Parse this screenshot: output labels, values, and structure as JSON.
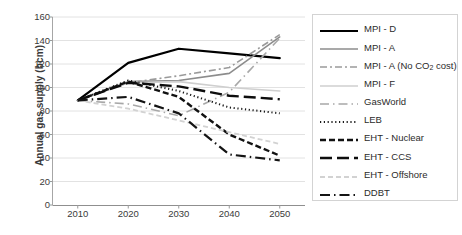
{
  "chart_data": {
    "type": "line",
    "title": "",
    "xlabel": "",
    "ylabel": "Annual gas supply (bcm)",
    "x": [
      2010,
      2020,
      2030,
      2040,
      2050
    ],
    "xtick_labels": [
      "2010",
      "2020",
      "2030",
      "2040",
      "2050"
    ],
    "ytick_labels": [
      "0",
      "20",
      "40",
      "60",
      "80",
      "100",
      "120",
      "140",
      "160"
    ],
    "yticks": [
      0,
      20,
      40,
      60,
      80,
      100,
      120,
      140,
      160
    ],
    "ylim": [
      0,
      160
    ],
    "xlim": [
      2005,
      2055
    ],
    "grid": "horizontal",
    "legend_position": "right",
    "series": [
      {
        "name": "MPI - D",
        "label": "MPI - D",
        "values": [
          89,
          121,
          133,
          129,
          125
        ],
        "color": "#000000",
        "width": 2.2,
        "dash": "none"
      },
      {
        "name": "MPI - A",
        "label": "MPI - A",
        "values": [
          89,
          105,
          106,
          112,
          143
        ],
        "color": "#8c8c8c",
        "width": 1.6,
        "dash": "none"
      },
      {
        "name": "MPI - A (No CO2 cost)",
        "label": "MPI - A (No CO",
        "label_sub": "2",
        "label_tail": " cost)",
        "values": [
          89,
          104,
          110,
          117,
          145
        ],
        "color": "#9a9a9a",
        "width": 1.6,
        "dash": "7,3,2,3"
      },
      {
        "name": "MPI - F",
        "label": "MPI - F",
        "values": [
          89,
          104,
          105,
          100,
          97
        ],
        "color": "#cfcfcf",
        "width": 1.6,
        "dash": "none"
      },
      {
        "name": "GasWorld",
        "label": "GasWorld",
        "values": [
          89,
          86,
          76,
          96,
          142
        ],
        "color": "#a8a8a8",
        "width": 1.6,
        "dash": "9,4,1.5,4"
      },
      {
        "name": "LEB",
        "label": "LEB",
        "values": [
          89,
          106,
          97,
          83,
          78
        ],
        "color": "#1a1a1a",
        "width": 2.0,
        "dash": "1.2,2.6"
      },
      {
        "name": "EHT - Nuclear",
        "label": "EHT - Nuclear",
        "values": [
          89,
          105,
          92,
          60,
          42
        ],
        "color": "#111111",
        "width": 2.4,
        "dash": "6,3"
      },
      {
        "name": "EHT - CCS",
        "label": "EHT - CCS",
        "values": [
          89,
          104,
          101,
          93,
          90
        ],
        "color": "#0d0d0d",
        "width": 2.4,
        "dash": "12,5"
      },
      {
        "name": "EHT - Offshore",
        "label": "EHT - Offshore",
        "values": [
          89,
          82,
          72,
          62,
          52
        ],
        "color": "#d2d2d2",
        "width": 1.8,
        "dash": "5,3"
      },
      {
        "name": "DDBT",
        "label": "DDBT",
        "values": [
          89,
          92,
          78,
          43,
          38
        ],
        "color": "#141414",
        "width": 2.2,
        "dash": "10,4,1.5,4"
      }
    ]
  }
}
